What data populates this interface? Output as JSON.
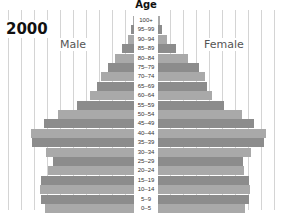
{
  "chart_data": {
    "type": "bar",
    "subtype": "population-pyramid",
    "title": "2000",
    "axis_title": "Age",
    "xlabel": "",
    "ylabel": "Age",
    "legend": [
      "Male",
      "Female"
    ],
    "grid": true,
    "categories": [
      "100+",
      "95–99",
      "90–94",
      "85–89",
      "80–84",
      "75–79",
      "70–74",
      "65–69",
      "60–64",
      "55–59",
      "50–54",
      "45–49",
      "40–44",
      "35–39",
      "30–34",
      "25–29",
      "20–24",
      "15–19",
      "10–14",
      "5–9",
      "0–5"
    ],
    "series": [
      {
        "name": "Male",
        "values": [
          1,
          3,
          6,
          12,
          19,
          26,
          33,
          37,
          44,
          57,
          76,
          90,
          103,
          102,
          88,
          81,
          86,
          93,
          94,
          93,
          89
        ]
      },
      {
        "name": "Female",
        "values": [
          2,
          4,
          9,
          18,
          30,
          41,
          47,
          49,
          54,
          66,
          84,
          96,
          108,
          106,
          93,
          85,
          86,
          91,
          92,
          91,
          87
        ]
      }
    ],
    "units": "relative bar length (px from center axis)"
  },
  "labels": {
    "year": "2000",
    "age": "Age",
    "male": "Male",
    "female": "Female"
  }
}
